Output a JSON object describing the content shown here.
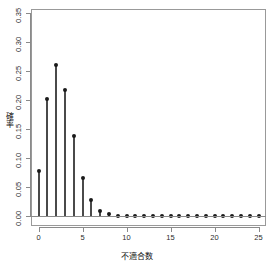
{
  "chart_data": {
    "type": "scatter",
    "title": "",
    "subtitle": "",
    "xlabel": "不適合数",
    "ylabel": "確率",
    "style": "stem-plot (R type='h' with points)",
    "grid": false,
    "legend": null,
    "xlim": [
      -0.5,
      25.5
    ],
    "ylim": [
      0.0,
      0.35
    ],
    "xticks": [
      0,
      5,
      10,
      15,
      20,
      25
    ],
    "xtick_labels": [
      "0",
      "5",
      "10",
      "15",
      "20",
      "25"
    ],
    "yticks": [
      0.0,
      0.05,
      0.1,
      0.15,
      0.2,
      0.25,
      0.3,
      0.35
    ],
    "ytick_labels": [
      "0.00",
      "0.05",
      "0.10",
      "0.15",
      "0.20",
      "0.25",
      "0.30",
      "0.35"
    ],
    "x": [
      0,
      1,
      2,
      3,
      4,
      5,
      6,
      7,
      8,
      9,
      10,
      11,
      12,
      13,
      14,
      15,
      16,
      17,
      18,
      19,
      20,
      21,
      22,
      23,
      24,
      25
    ],
    "categories": [
      "0",
      "1",
      "2",
      "3",
      "4",
      "5",
      "6",
      "7",
      "8",
      "9",
      "10",
      "11",
      "12",
      "13",
      "14",
      "15",
      "16",
      "17",
      "18",
      "19",
      "20",
      "21",
      "22",
      "23",
      "24",
      "25"
    ],
    "values": [
      0.0773,
      0.2017,
      0.2612,
      0.2172,
      0.1376,
      0.066,
      0.027,
      0.009,
      0.0028,
      0.0008,
      0.0002,
      0.0001,
      0.0,
      0.0,
      0.0,
      0.0,
      0.0,
      0.0,
      0.0,
      0.0,
      0.0,
      0.0,
      0.0,
      0.0,
      0.0,
      0.0
    ],
    "series": [
      {
        "name": "確率",
        "values": [
          0.0773,
          0.2017,
          0.2612,
          0.2172,
          0.1376,
          0.066,
          0.027,
          0.009,
          0.0028,
          0.0008,
          0.0002,
          0.0001,
          0.0,
          0.0,
          0.0,
          0.0,
          0.0,
          0.0,
          0.0,
          0.0,
          0.0,
          0.0,
          0.0,
          0.0,
          0.0,
          0.0
        ]
      }
    ],
    "colors": {
      "stem": "#4a4a4a",
      "point": "#1a1a1a",
      "axis": "#8a8a8a",
      "frame": "#999999",
      "background": "#ffffff",
      "text": "#111111"
    }
  }
}
